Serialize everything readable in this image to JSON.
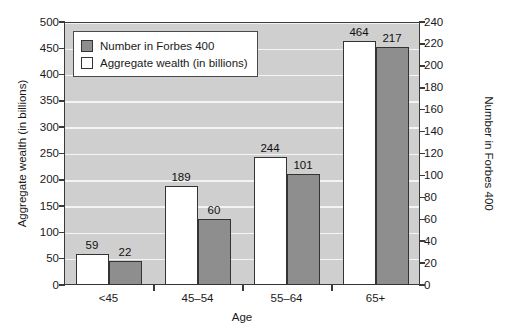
{
  "chart_data": {
    "type": "bar",
    "title": "",
    "xlabel": "Age",
    "ylabel": "Aggregate wealth (in billions)",
    "ylabel_right": "Number in Forbes 400",
    "categories": [
      "<45",
      "45–54",
      "55–64",
      "65+"
    ],
    "series": [
      {
        "name": "Aggregate wealth (in billions)",
        "axis": "left",
        "color": "#ffffff",
        "values": [
          59,
          189,
          244,
          464
        ]
      },
      {
        "name": "Number in Forbes 400",
        "axis": "right",
        "color": "#8e8e8e",
        "values": [
          22,
          60,
          101,
          217
        ]
      }
    ],
    "ylim": [
      0,
      500
    ],
    "ylim_right": [
      0,
      240
    ],
    "yticks": [
      0,
      50,
      100,
      150,
      200,
      250,
      300,
      350,
      400,
      450,
      500
    ],
    "yticks_right": [
      0,
      20,
      40,
      60,
      80,
      100,
      120,
      140,
      160,
      180,
      200,
      220,
      240
    ],
    "grid": true,
    "legend_position": "upper-left-inside",
    "plot_background": "#cfcfcf",
    "gridline_color": "#f4f4f4",
    "axis_color": "#3a3a3a"
  },
  "legend": {
    "items": [
      {
        "label": "Number in Forbes 400",
        "swatch": "count"
      },
      {
        "label": "Aggregate wealth (in billions)",
        "swatch": "wealth"
      }
    ]
  }
}
